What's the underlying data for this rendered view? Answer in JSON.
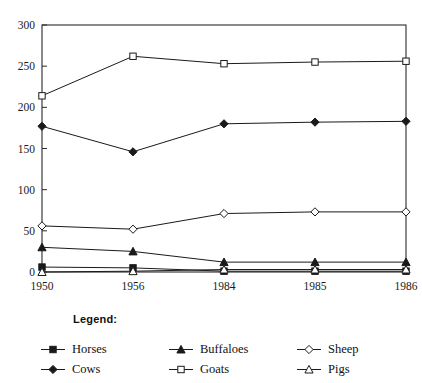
{
  "chart_data": {
    "type": "line",
    "title": "",
    "xlabel": "",
    "ylabel": "",
    "categories": [
      "1950",
      "1956",
      "1984",
      "1985",
      "1986"
    ],
    "ylim": [
      0,
      300
    ],
    "yticks": [
      0,
      50,
      100,
      150,
      200,
      250,
      300
    ],
    "grid": false,
    "legend_position": "bottom",
    "series": [
      {
        "name": "Horses",
        "values": [
          6,
          5,
          1,
          1,
          1
        ],
        "marker": "filled-square",
        "color": "#1a1a1a"
      },
      {
        "name": "Cows",
        "values": [
          177,
          146,
          180,
          182,
          183
        ],
        "marker": "filled-diamond",
        "color": "#1a1a1a"
      },
      {
        "name": "Buffaloes",
        "values": [
          30,
          25,
          12,
          12,
          12
        ],
        "marker": "filled-triangle",
        "color": "#1a1a1a"
      },
      {
        "name": "Goats",
        "values": [
          214,
          262,
          253,
          255,
          256
        ],
        "marker": "open-square",
        "color": "#1a1a1a"
      },
      {
        "name": "Sheep",
        "values": [
          56,
          52,
          71,
          73,
          73
        ],
        "marker": "open-diamond",
        "color": "#1a1a1a"
      },
      {
        "name": "Pigs",
        "values": [
          0,
          1,
          3,
          3,
          3
        ],
        "marker": "open-triangle",
        "color": "#1a1a1a"
      }
    ]
  },
  "legend": {
    "heading": "Legend:",
    "entries": [
      {
        "label": "Horses",
        "marker": "filled-square"
      },
      {
        "label": "Cows",
        "marker": "filled-diamond"
      },
      {
        "label": "Buffaloes",
        "marker": "filled-triangle"
      },
      {
        "label": "Goats",
        "marker": "open-square"
      },
      {
        "label": "Sheep",
        "marker": "open-diamond"
      },
      {
        "label": "Pigs",
        "marker": "open-triangle"
      }
    ]
  },
  "axes": {
    "y_tick_labels": [
      "300",
      "250",
      "200",
      "150",
      "100",
      "50",
      "0"
    ],
    "x_tick_labels": [
      "1950",
      "1956",
      "1984",
      "1985",
      "1986"
    ]
  },
  "colors": {
    "ink": "#1a1a1a",
    "axis": "#2b2b2b",
    "background": "#ffffff"
  }
}
